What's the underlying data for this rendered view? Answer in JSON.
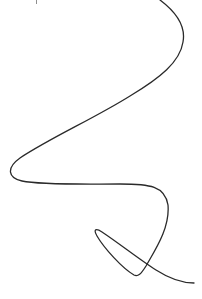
{
  "figure": {
    "stroke_color": "#2a2a2a",
    "background_color": "#ffffff"
  }
}
